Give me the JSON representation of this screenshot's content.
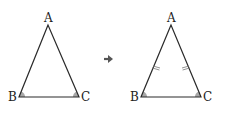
{
  "colors": {
    "line": "#2a2a2a",
    "angle_fill": "#a8a8a8",
    "arrow": "#555555",
    "text": "#222222"
  },
  "left_triangle": {
    "vertices": {
      "A": "A",
      "B": "B",
      "C": "C"
    },
    "marked_angles": [
      "B",
      "C"
    ],
    "equal_side_ticks": false
  },
  "arrow": {
    "icon": "arrow-right-icon"
  },
  "right_triangle": {
    "vertices": {
      "A": "A",
      "B": "B",
      "C": "C"
    },
    "marked_angles": [
      "B",
      "C"
    ],
    "equal_side_ticks": true,
    "ticked_sides": [
      "AB",
      "AC"
    ]
  }
}
